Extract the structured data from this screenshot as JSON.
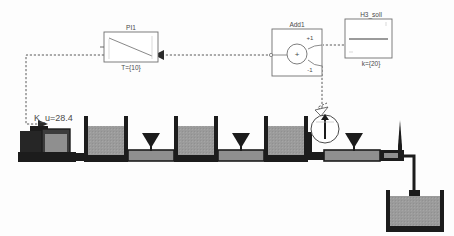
{
  "diagram": {
    "type": "modelica-block-diagram"
  },
  "colors": {
    "fluid": "#9b9b9b",
    "frame": "#1c1c1c",
    "signal": "#5a5a5a",
    "block_stroke": "#6f6f6f",
    "block_fill": "#ffffff",
    "text": "#4a4a4a",
    "pump_dark": "#262626"
  },
  "blocks": {
    "controller": {
      "name": "PI1",
      "label": "PI1",
      "parameter": "T={10}",
      "kind": "pi-controller"
    },
    "adder": {
      "name": "Add1",
      "label": "Add1",
      "operator": "+",
      "input_plus": "+1",
      "input_minus": "-1",
      "kind": "summation"
    },
    "setpoint": {
      "name": "H3_soll",
      "label": "H3_soll",
      "parameter": "k={20}",
      "kind": "constant-source"
    }
  },
  "plant": {
    "gain_label": "K_u=28.4",
    "pump": {
      "name": "pump",
      "label": ""
    },
    "tanks": [
      {
        "id": "tank1",
        "fill_level": 0.78
      },
      {
        "id": "tank2",
        "fill_level": 0.78
      },
      {
        "id": "tank3",
        "fill_level": 0.78
      },
      {
        "id": "reservoir",
        "fill_level": 0.86
      }
    ],
    "valves": [
      {
        "id": "valve1"
      },
      {
        "id": "valve2"
      },
      {
        "id": "valve3"
      },
      {
        "id": "valve-outlet"
      }
    ],
    "sensor": {
      "id": "level-sensor",
      "kind": "gauge"
    }
  },
  "signals": [
    {
      "id": "setpoint-to-add",
      "from": "H3_soll",
      "to": "Add1.+1"
    },
    {
      "id": "sensor-to-add",
      "from": "level-sensor",
      "to": "Add1.-1"
    },
    {
      "id": "add-to-pi",
      "from": "Add1",
      "to": "PI1"
    },
    {
      "id": "pi-to-pump",
      "from": "PI1",
      "to": "pump"
    }
  ]
}
